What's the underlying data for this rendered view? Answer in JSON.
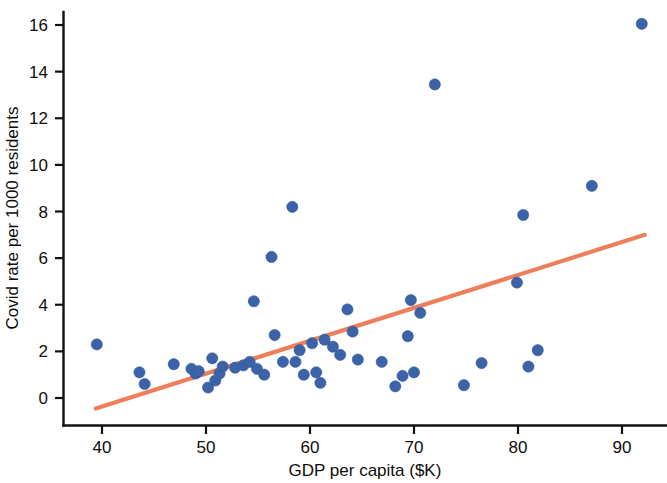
{
  "chart_data": {
    "type": "scatter",
    "title": "",
    "xlabel": "GDP per capita ($K)",
    "ylabel": "Covid rate per 1000 residents",
    "xlim": [
      36.5,
      96.0
    ],
    "ylim": [
      -1.4,
      16.9
    ],
    "xticks": [
      40,
      50,
      60,
      70,
      80,
      90
    ],
    "xtick_labels": [
      "40",
      "50",
      "60",
      "70",
      "80",
      "90"
    ],
    "yticks": [
      0,
      2,
      4,
      6,
      8,
      10,
      12,
      14,
      16
    ],
    "ytick_labels": [
      "0",
      "2",
      "4",
      "6",
      "8",
      "10",
      "12",
      "14",
      "16"
    ],
    "grid": false,
    "legend": null,
    "point_color": "#3c63a8",
    "trend_color": "#ee7f5c",
    "series": [
      {
        "name": "US states",
        "marker": "circle",
        "color": "#3c63a8",
        "points": [
          [
            39.5,
            2.3
          ],
          [
            43.6,
            1.1
          ],
          [
            44.1,
            0.6
          ],
          [
            46.9,
            1.45
          ],
          [
            48.6,
            1.25
          ],
          [
            49.0,
            1.05
          ],
          [
            49.3,
            1.15
          ],
          [
            50.2,
            0.45
          ],
          [
            50.6,
            1.7
          ],
          [
            50.9,
            0.75
          ],
          [
            51.3,
            1.05
          ],
          [
            51.6,
            1.35
          ],
          [
            52.8,
            1.3
          ],
          [
            53.6,
            1.4
          ],
          [
            54.2,
            1.55
          ],
          [
            54.6,
            4.15
          ],
          [
            54.9,
            1.25
          ],
          [
            55.6,
            1.0
          ],
          [
            56.3,
            6.05
          ],
          [
            56.6,
            2.7
          ],
          [
            57.4,
            1.55
          ],
          [
            58.3,
            8.2
          ],
          [
            58.6,
            1.55
          ],
          [
            59.0,
            2.05
          ],
          [
            59.4,
            1.0
          ],
          [
            60.2,
            2.35
          ],
          [
            60.6,
            1.1
          ],
          [
            61.0,
            0.65
          ],
          [
            61.4,
            2.5
          ],
          [
            62.2,
            2.2
          ],
          [
            62.9,
            1.85
          ],
          [
            63.6,
            3.8
          ],
          [
            64.1,
            2.85
          ],
          [
            64.6,
            1.65
          ],
          [
            66.9,
            1.55
          ],
          [
            68.2,
            0.5
          ],
          [
            68.9,
            0.95
          ],
          [
            69.4,
            2.65
          ],
          [
            69.7,
            4.2
          ],
          [
            70.0,
            1.1
          ],
          [
            70.6,
            3.65
          ],
          [
            72.0,
            13.45
          ],
          [
            74.8,
            0.55
          ],
          [
            76.5,
            1.5
          ],
          [
            79.9,
            4.95
          ],
          [
            80.5,
            7.85
          ],
          [
            81.0,
            1.35
          ],
          [
            81.9,
            2.05
          ],
          [
            87.1,
            9.1
          ],
          [
            91.9,
            16.05
          ]
        ]
      }
    ],
    "trend": {
      "type": "line",
      "color": "#ee7f5c",
      "x_start": 39.4,
      "y_start": -0.45,
      "x_end": 92.2,
      "y_end": 7.0
    }
  }
}
